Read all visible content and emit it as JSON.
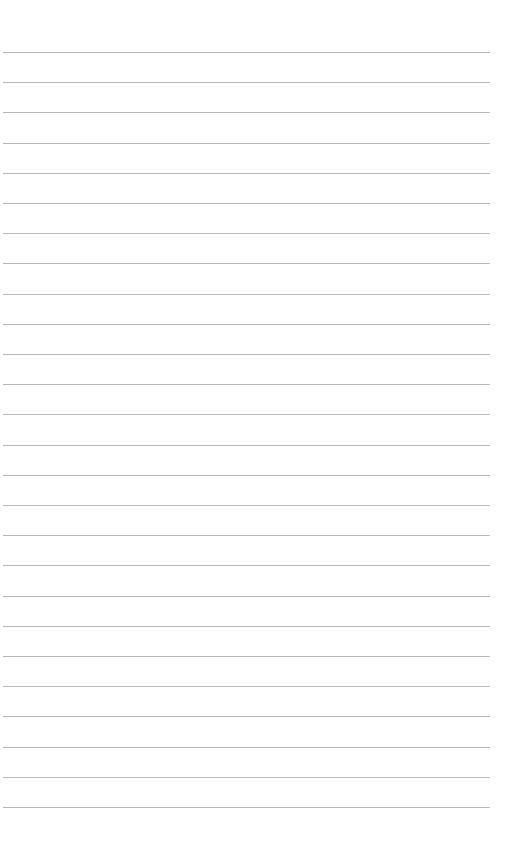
{
  "document": {
    "type": "lined-paper",
    "background_color": "#ffffff",
    "rule_color": "#b9b9b9",
    "rule_count": 26,
    "first_rule_y": 52,
    "rule_spacing": 30.2,
    "rule_left": 3,
    "rule_width": 487,
    "text": []
  }
}
